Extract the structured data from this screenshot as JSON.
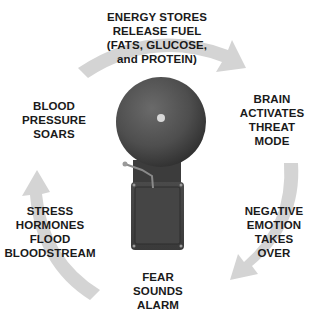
{
  "diagram": {
    "type": "cycle",
    "center": {
      "icon": "alarm-bell-icon"
    },
    "arrow_color": "#d4d4d4",
    "text_color": "#1a1a1a",
    "steps": [
      {
        "id": "top",
        "lines": [
          "ENERGY STORES",
          "RELEASE FUEL",
          "(FATS, GLUCOSE,",
          "and PROTEIN)"
        ]
      },
      {
        "id": "right-top",
        "lines": [
          "BRAIN",
          "ACTIVATES",
          "THREAT",
          "MODE"
        ]
      },
      {
        "id": "right-bottom",
        "lines": [
          "NEGATIVE",
          "EMOTION",
          "TAKES",
          "OVER"
        ]
      },
      {
        "id": "bottom",
        "lines": [
          "FEAR",
          "SOUNDS",
          "ALARM"
        ]
      },
      {
        "id": "left-bottom",
        "lines": [
          "STRESS",
          "HORMONES",
          "FLOOD",
          "BLOODSTREAM"
        ]
      },
      {
        "id": "left-top",
        "lines": [
          "BLOOD",
          "PRESSURE",
          "SOARS"
        ]
      }
    ]
  }
}
